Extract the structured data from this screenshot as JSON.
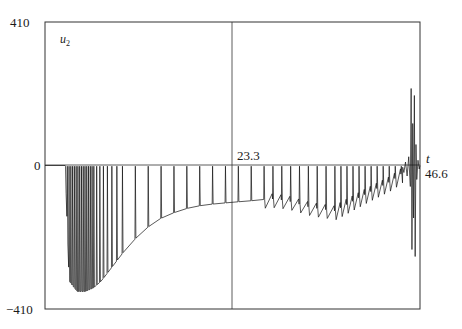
{
  "chart_data": {
    "type": "line",
    "title": "",
    "ylabel": "u",
    "ylabel_subscript": "2",
    "xlabel": "t",
    "ylim": [
      -410,
      410
    ],
    "xlim": [
      0,
      46.6
    ],
    "y_ticks": [
      "410",
      "0",
      "-410"
    ],
    "x_ticks": [
      "23.3",
      "46.6"
    ],
    "grid": false,
    "legend": null,
    "series": [
      {
        "name": "u2(t)",
        "description": "Spiking signal: flat at 0 until t≈2.5, then dense oscillation bursts dropping to about -360 near t≈4-5, envelope rising to about -110 by t≈23.3, periodic spikes reaching 0, sawtooth oscillations between about -150 and 0 for t=27-43, then large oscillations reaching about +220 and -240 near t≈45-46.",
        "envelope_x": [
          2.5,
          3,
          4,
          5,
          6,
          7,
          8,
          10,
          12,
          14,
          16,
          18,
          20,
          23.3,
          26,
          28,
          30,
          33,
          36,
          40,
          43,
          44.5,
          45.5,
          46.6
        ],
        "envelope_y": [
          0,
          -330,
          -360,
          -360,
          -350,
          -330,
          -300,
          -240,
          -190,
          -155,
          -135,
          -120,
          -112,
          -105,
          -100,
          -95,
          -100,
          -120,
          -130,
          -80,
          -45,
          -20,
          0,
          0
        ]
      }
    ]
  }
}
